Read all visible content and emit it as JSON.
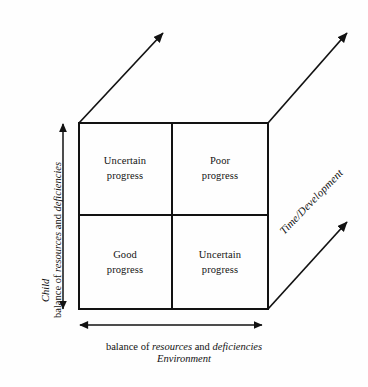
{
  "figure": {
    "type": "2x2-matrix-cube-diagram",
    "background_color": "#fefefe",
    "line_color": "#121212"
  },
  "quadrants": [
    {
      "id": "top-left",
      "line1": "Uncertain",
      "line2": "progress"
    },
    {
      "id": "top-right",
      "line1": "Poor",
      "line2": "progress"
    },
    {
      "id": "bottom-left",
      "line1": "Good",
      "line2": "progress"
    },
    {
      "id": "bottom-right",
      "line1": "Uncertain",
      "line2": "progress"
    }
  ],
  "axes": {
    "y": {
      "title": "Child",
      "description_prefix": "balance of ",
      "description_word1": "resources",
      "description_middle": " and ",
      "description_word2": "deficiencies"
    },
    "x": {
      "description_prefix": "balance of ",
      "description_word1": "resources",
      "description_middle": " and ",
      "description_word2": "deficiencies",
      "title": "Environment"
    },
    "z": {
      "title": "Time/Development"
    }
  }
}
